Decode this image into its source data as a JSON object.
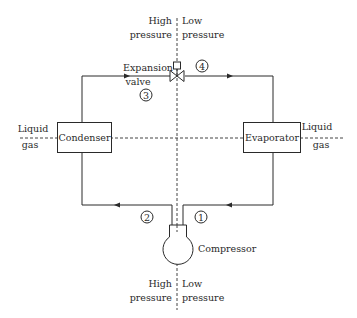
{
  "diagram": {
    "type": "refrigeration-cycle",
    "top_divider": {
      "left": [
        "High",
        "pressure"
      ],
      "right": [
        "Low",
        "pressure"
      ]
    },
    "bottom_divider": {
      "left": [
        "High",
        "pressure"
      ],
      "right": [
        "Low",
        "pressure"
      ]
    },
    "components": {
      "condenser": "Condenser",
      "evaporator": "Evaporator",
      "compressor": "Compressor",
      "expansion_valve": [
        "Expansion",
        "valve"
      ]
    },
    "phase_labels": {
      "left": {
        "top": "Liquid",
        "bottom": "gas"
      },
      "right": {
        "top": "Liquid",
        "bottom": "gas"
      }
    },
    "state_points": [
      "1",
      "2",
      "3",
      "4"
    ],
    "colors": {
      "line": "#2a2a2a",
      "background": "#ffffff"
    }
  }
}
